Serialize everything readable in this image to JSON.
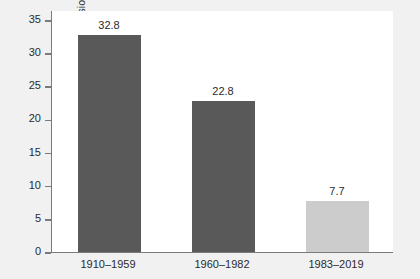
{
  "chart_data": {
    "type": "bar",
    "title": "",
    "subtitle": "",
    "xlabel": "",
    "ylabel": "Percent of time in recession",
    "categories": [
      "1910–1959",
      "1960–1982",
      "1983–2019"
    ],
    "values": [
      32.8,
      22.8,
      7.7
    ],
    "value_labels": [
      "32.8",
      "22.8",
      "7.7"
    ],
    "bar_colors": [
      "#595959",
      "#595959",
      "#cccccc"
    ],
    "ylim": [
      0,
      36.5
    ],
    "yticks": [
      0,
      5,
      10,
      15,
      20,
      25,
      30,
      35
    ],
    "ytick_labels": [
      "0",
      "5",
      "10",
      "15",
      "20",
      "25",
      "30",
      "35"
    ],
    "grid": false,
    "legend": false,
    "legend_position": "none",
    "axis_color": "#7a7a7a",
    "plot_background": "#ffffff",
    "figure_background": "#f1f1f1",
    "text_color": "#2b2b2b"
  }
}
